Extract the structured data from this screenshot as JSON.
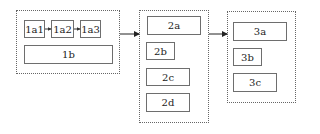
{
  "groups": [
    {
      "id": "1",
      "boxes": [
        {
          "label": "1a1"
        },
        {
          "label": "1a2"
        },
        {
          "label": "1a3"
        },
        {
          "label": "1b"
        }
      ]
    },
    {
      "id": "2",
      "boxes": [
        {
          "label": "2a"
        },
        {
          "label": "2b"
        },
        {
          "label": "2c"
        },
        {
          "label": "2d"
        }
      ]
    },
    {
      "id": "3",
      "boxes": [
        {
          "label": "3a"
        },
        {
          "label": "3b"
        },
        {
          "label": "3c"
        }
      ]
    }
  ],
  "edges": [
    {
      "from": "1a1",
      "to": "1a2"
    },
    {
      "from": "1a2",
      "to": "1a3"
    },
    {
      "from": "group-1",
      "to": "group-2"
    },
    {
      "from": "group-2",
      "to": "group-3"
    }
  ],
  "colors": {
    "box_border": "#6e6e6e",
    "group_border": "#666666",
    "arrow": "#222222",
    "text": "#222222"
  }
}
